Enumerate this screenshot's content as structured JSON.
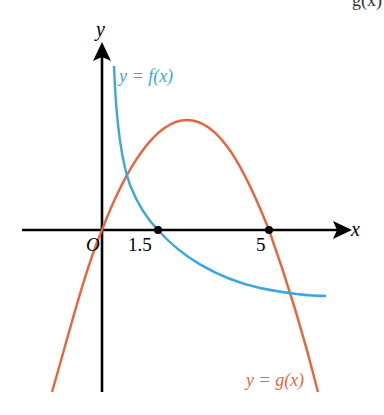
{
  "header_fragment": "g(x)",
  "axes": {
    "x_label": "x",
    "y_label": "y",
    "origin_label": "O"
  },
  "points": [
    {
      "label": "1.5",
      "x": 1.5,
      "y": 0
    },
    {
      "label": "5",
      "x": 5,
      "y": 0
    }
  ],
  "curves": {
    "f": {
      "label": "y = f(x)",
      "color": "#3aa6dc"
    },
    "g": {
      "label": "y = g(x)",
      "color": "#e8643c"
    }
  },
  "colors": {
    "axis": "#000000",
    "f": "#3aa6dc",
    "g": "#e8643c"
  }
}
